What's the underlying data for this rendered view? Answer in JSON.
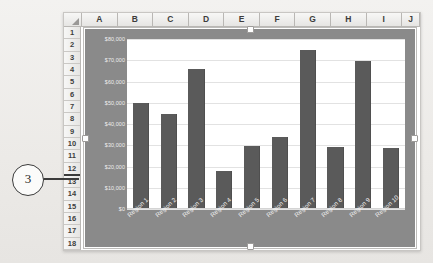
{
  "callout": {
    "number": "3"
  },
  "spreadsheet": {
    "columns": [
      "A",
      "B",
      "C",
      "D",
      "E",
      "F",
      "G",
      "H",
      "I",
      "J"
    ],
    "rows": [
      "1",
      "2",
      "3",
      "4",
      "5",
      "6",
      "7",
      "8",
      "9",
      "10",
      "11",
      "12",
      "13",
      "14",
      "15",
      "16",
      "17",
      "18"
    ],
    "marked_row": "12",
    "select_all_icon": "select-all-triangle-icon"
  },
  "chart_data": {
    "type": "bar",
    "title": "",
    "xlabel": "",
    "ylabel": "",
    "categories": [
      "Region 1",
      "Region 2",
      "Region 3",
      "Region 4",
      "Region 5",
      "Region 6",
      "Region 7",
      "Region 8",
      "Region 9",
      "Region 10"
    ],
    "values": [
      50000,
      44500,
      66000,
      18000,
      29500,
      34000,
      75000,
      29000,
      69500,
      28500
    ],
    "ylim": [
      0,
      80000
    ],
    "yticks": [
      80000,
      70000,
      60000,
      50000,
      40000,
      30000,
      20000,
      10000,
      0
    ],
    "ytick_labels": [
      "$80,000",
      "$70,000",
      "$60,000",
      "$50,000",
      "$40,000",
      "$30,000",
      "$20,000",
      "$10,000",
      "$0"
    ],
    "grid": true,
    "legend": false,
    "series_color": "#5a5a5a",
    "plot_background": "#ffffff",
    "chart_background": "#8a8a8a"
  }
}
